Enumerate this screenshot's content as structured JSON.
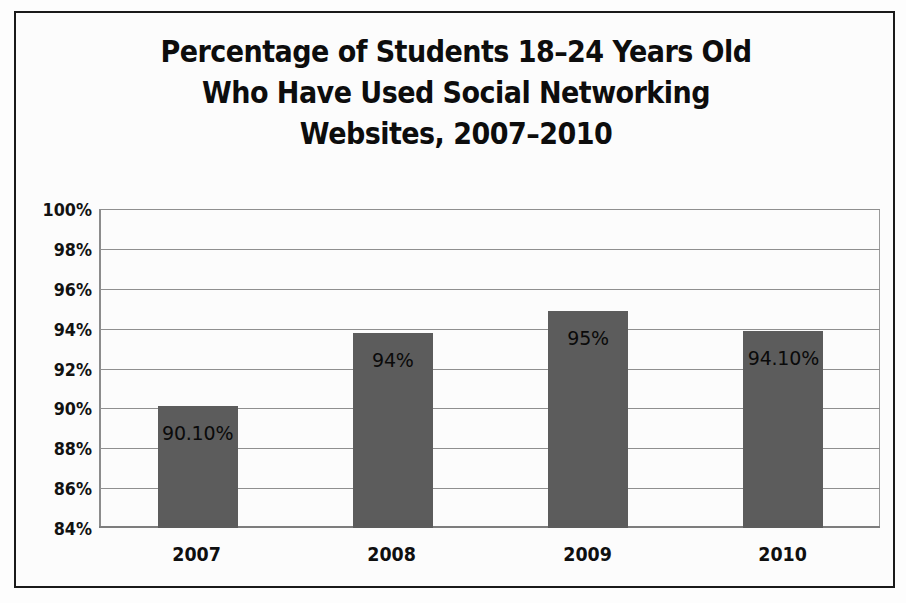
{
  "chart_data": {
    "type": "bar",
    "title": "Percentage of Students 18–24 Years Old\nWho Have Used Social Networking\nWebsites, 2007–2010",
    "title_lines": [
      "Percentage of Students 18–24 Years Old",
      "Who Have Used Social Networking",
      "Websites, 2007–2010"
    ],
    "xlabel": "",
    "ylabel": "",
    "categories": [
      "2007",
      "2008",
      "2009",
      "2010"
    ],
    "values": [
      90.1,
      93.8,
      94.9,
      93.9
    ],
    "data_labels": [
      "90.10%",
      "94%",
      "95%",
      "94.10%"
    ],
    "series": [
      {
        "name": "Percentage of students who have used social networking websites",
        "values": [
          90.1,
          93.8,
          94.9,
          93.9
        ]
      }
    ],
    "ylim": [
      84,
      100
    ],
    "ytick_values": [
      100,
      98,
      96,
      94,
      92,
      90,
      88,
      86,
      84
    ],
    "ytick_labels": [
      "100%",
      "98%",
      "96%",
      "94%",
      "92%",
      "90%",
      "88%",
      "86%",
      "84%"
    ],
    "ytick_step": 2,
    "grid": true,
    "grid_axis": "y",
    "legend": false,
    "legend_position": "none",
    "bar_color": "#5c5c5c",
    "gridline_color": "#8f8f8f",
    "frame_color": "#1a1a1a",
    "background_color": "#fcfcfc",
    "annotations": []
  },
  "figure": {
    "frame_visible": true
  }
}
